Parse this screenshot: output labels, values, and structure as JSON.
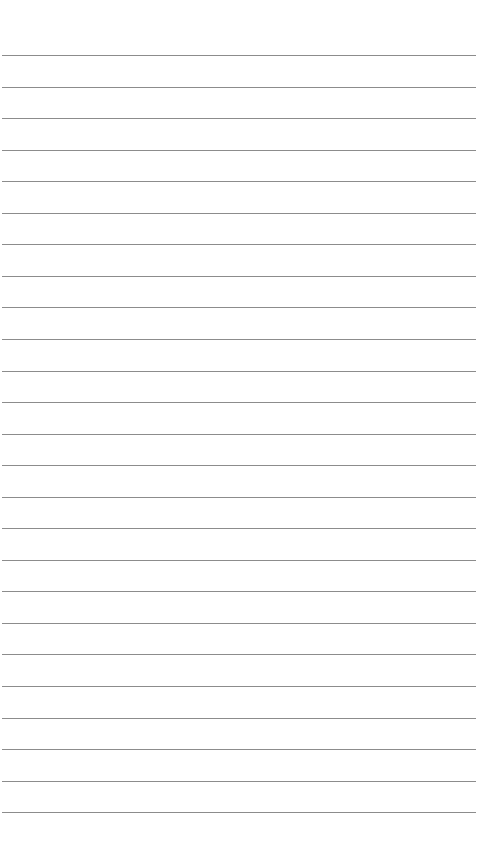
{
  "page": {
    "type": "lined-paper",
    "background_color": "#ffffff",
    "line_color": "#8c8c8c",
    "line_count": 25,
    "first_line_y": 55,
    "line_spacing": 31.55,
    "line_left": 2,
    "line_right": 476,
    "text": []
  }
}
